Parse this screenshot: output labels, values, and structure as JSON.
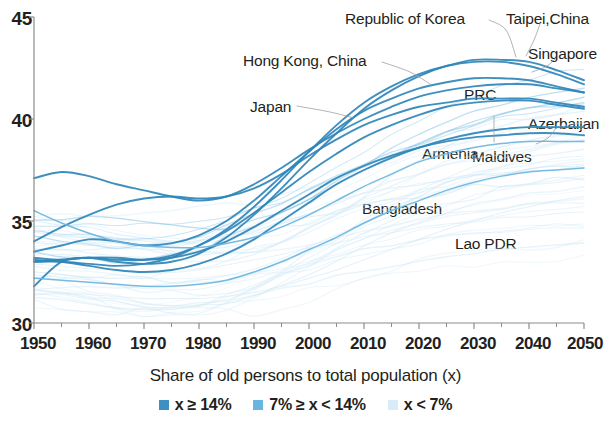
{
  "chart_data": {
    "type": "line",
    "title": "",
    "subtitle": "",
    "xlabel": "",
    "ylabel": "",
    "caption": "Share of old persons to total population (x)",
    "xlim": [
      1950,
      2050
    ],
    "ylim": [
      30,
      45
    ],
    "grid": false,
    "legend_position": "bottom-center",
    "x_ticks": [
      "1950",
      "1960",
      "1970",
      "1980",
      "1990",
      "2000",
      "2010",
      "2020",
      "2030",
      "2040",
      "2050"
    ],
    "x_tick_values": [
      1950,
      1960,
      1970,
      1980,
      1990,
      2000,
      2010,
      2020,
      2030,
      2040,
      2050
    ],
    "x_minor_tick_values": [
      1955,
      1965,
      1975,
      1985,
      1995,
      2005,
      2015,
      2025,
      2035,
      2045
    ],
    "y_ticks": [
      "30",
      "35",
      "40",
      "45"
    ],
    "y_tick_values": [
      30,
      35,
      40,
      45
    ],
    "colors": {
      "tier_high": "#2e86b8",
      "tier_mid": "#6ab5e0",
      "tier_low": "#cfe8f6",
      "axis": "#8c8c8c",
      "text": "#231f20",
      "leader": "#9b9b9b"
    },
    "legend": [
      {
        "label": "x ≥ 14%",
        "color": "#3e8fc4",
        "tier": "tier_high"
      },
      {
        "label": "7% ≥ x < 14%",
        "color": "#6ab5e0",
        "tier": "tier_mid"
      },
      {
        "label": "x < 7%",
        "color": "#d7ecf8",
        "tier": "tier_low"
      }
    ],
    "x": [
      1950,
      1955,
      1960,
      1965,
      1970,
      1975,
      1980,
      1985,
      1990,
      1995,
      2000,
      2005,
      2010,
      2015,
      2020,
      2025,
      2030,
      2035,
      2040,
      2045,
      2050
    ],
    "series": [
      {
        "name": "Republic of Korea",
        "tier": "tier_high",
        "label_x": 345,
        "label_y": 10,
        "leader": [
          [
            489,
            20
          ],
          [
            506,
            30
          ],
          [
            516,
            57
          ]
        ],
        "values": [
          33.2,
          33.1,
          33.2,
          33.0,
          32.9,
          33.0,
          33.4,
          34.2,
          35.3,
          36.6,
          38.0,
          39.3,
          40.5,
          41.4,
          42.1,
          42.6,
          42.9,
          42.9,
          42.8,
          42.4,
          41.9
        ]
      },
      {
        "name": "Taipei,China",
        "tier": "tier_high",
        "label_x": 506,
        "label_y": 10,
        "leader": [
          [
            540,
            24
          ],
          [
            534,
            40
          ],
          [
            526,
            56
          ]
        ],
        "values": [
          33.0,
          33.0,
          32.9,
          32.8,
          32.9,
          33.2,
          33.8,
          34.6,
          35.7,
          37.0,
          38.4,
          39.7,
          40.8,
          41.6,
          42.2,
          42.6,
          42.8,
          42.8,
          42.6,
          42.2,
          41.7
        ]
      },
      {
        "name": "Singapore",
        "tier": "tier_high",
        "label_x": 528,
        "label_y": 45,
        "leader": [
          [
            556,
            58
          ],
          [
            547,
            66
          ],
          [
            532,
            72
          ]
        ],
        "values": [
          33.5,
          33.8,
          34.1,
          34.0,
          33.8,
          33.9,
          34.3,
          35.0,
          36.0,
          37.2,
          38.4,
          39.5,
          40.4,
          41.0,
          41.5,
          41.8,
          42.0,
          42.0,
          41.9,
          41.6,
          41.3
        ]
      },
      {
        "name": "Hong Kong, China",
        "tier": "tier_high",
        "label_x": 243,
        "label_y": 52,
        "leader": [
          [
            382,
            62
          ],
          [
            410,
            72
          ],
          [
            430,
            84
          ]
        ],
        "values": [
          37.1,
          37.4,
          37.2,
          36.8,
          36.5,
          36.2,
          36.0,
          36.2,
          36.8,
          37.6,
          38.5,
          39.3,
          40.0,
          40.6,
          41.1,
          41.4,
          41.6,
          41.7,
          41.7,
          41.5,
          41.3
        ]
      },
      {
        "name": "PRC",
        "tier": "tier_high",
        "label_x": 464,
        "label_y": 86,
        "leader": [],
        "values": [
          33.0,
          33.1,
          33.2,
          33.1,
          33.1,
          33.3,
          33.8,
          34.5,
          35.4,
          36.4,
          37.4,
          38.3,
          39.1,
          39.7,
          40.2,
          40.6,
          40.8,
          40.9,
          40.9,
          40.7,
          40.5
        ]
      },
      {
        "name": "Japan",
        "tier": "tier_high",
        "label_x": 250,
        "label_y": 98,
        "leader": [
          [
            297,
            106
          ],
          [
            330,
            112
          ],
          [
            354,
            118
          ]
        ],
        "values": [
          34.0,
          34.7,
          35.3,
          35.8,
          36.1,
          36.2,
          36.1,
          36.2,
          36.6,
          37.3,
          38.2,
          39.0,
          39.7,
          40.2,
          40.6,
          40.8,
          41.0,
          41.0,
          41.0,
          40.8,
          40.6
        ]
      },
      {
        "name": "Azerbaijan",
        "tier": "tier_high",
        "label_x": 528,
        "label_y": 115,
        "leader": [
          [
            556,
            128
          ],
          [
            548,
            138
          ],
          [
            536,
            144
          ]
        ],
        "values": [
          33.1,
          33.0,
          32.8,
          32.6,
          32.5,
          32.6,
          32.9,
          33.4,
          34.1,
          35.0,
          35.9,
          36.8,
          37.5,
          38.1,
          38.6,
          39.0,
          39.3,
          39.5,
          39.6,
          39.6,
          39.6
        ]
      },
      {
        "name": "Armenia",
        "tier": "tier_high",
        "label_x": 422,
        "label_y": 145,
        "leader": [],
        "values": [
          31.8,
          33.0,
          33.2,
          33.2,
          33.1,
          33.2,
          33.5,
          34.0,
          34.7,
          35.5,
          36.3,
          37.1,
          37.7,
          38.2,
          38.6,
          38.9,
          39.1,
          39.2,
          39.3,
          39.3,
          39.2
        ]
      },
      {
        "name": "Maldives",
        "tier": "tier_mid",
        "label_x": 472,
        "label_y": 148,
        "leader": [
          [
            494,
            142
          ],
          [
            494,
            126
          ],
          [
            494,
            116
          ]
        ],
        "values": [
          35.5,
          34.9,
          34.4,
          34.0,
          33.8,
          33.7,
          33.7,
          33.9,
          34.2,
          34.7,
          35.3,
          36.0,
          36.7,
          37.3,
          37.9,
          38.3,
          38.6,
          38.8,
          38.9,
          38.9,
          38.9
        ]
      },
      {
        "name": "Bangladesh",
        "tier": "tier_mid",
        "label_x": 362,
        "label_y": 200,
        "leader": [],
        "values": [
          32.2,
          32.1,
          32.0,
          31.9,
          31.8,
          31.8,
          31.9,
          32.1,
          32.5,
          33.0,
          33.6,
          34.2,
          34.9,
          35.5,
          36.0,
          36.5,
          36.9,
          37.2,
          37.4,
          37.5,
          37.6
        ]
      },
      {
        "name": "Lao PDR",
        "tier": "tier_low",
        "label_x": 455,
        "label_y": 235,
        "leader": [],
        "values": [
          31.6,
          31.5,
          31.4,
          31.3,
          31.2,
          31.2,
          31.2,
          31.3,
          31.5,
          31.8,
          32.2,
          32.6,
          33.1,
          33.6,
          34.1,
          34.6,
          35.0,
          35.4,
          35.7,
          36.0,
          36.2
        ]
      }
    ],
    "background_series_count": 36
  }
}
